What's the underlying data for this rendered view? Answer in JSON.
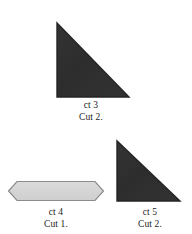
{
  "document": {
    "title": "Quilt Pattern Template Pieces",
    "background_color": "#ffffff"
  },
  "styles": {
    "triangle_fill": "#303030",
    "triangle_stroke": "#242424",
    "hexagon_fill": "#d6d6d6",
    "hexagon_stroke": "#8c8c8c",
    "text_color": "#1b1b1b"
  },
  "pieces": [
    {
      "id": "piece-3",
      "shape": "right-triangle",
      "fill": "#303030",
      "name_label": "ct 3",
      "cut_label": "Cut 2.",
      "points": "2,2 2,76 74,76",
      "width": 76,
      "height": 78
    },
    {
      "id": "piece-4",
      "shape": "elongated-hexagon",
      "fill": "#d6d6d6",
      "name_label": "ct 4",
      "cut_label": "Cut 1.",
      "points": "1.5,11 10,1.5 88,1.5 96.5,11 88,20.5 10,20.5",
      "width": 98,
      "height": 22
    },
    {
      "id": "piece-5",
      "shape": "right-triangle",
      "fill": "#303030",
      "name_label": "ct 5",
      "cut_label": "Cut 2.",
      "points": "2,2 2,62 65,62",
      "width": 67,
      "height": 64
    }
  ]
}
